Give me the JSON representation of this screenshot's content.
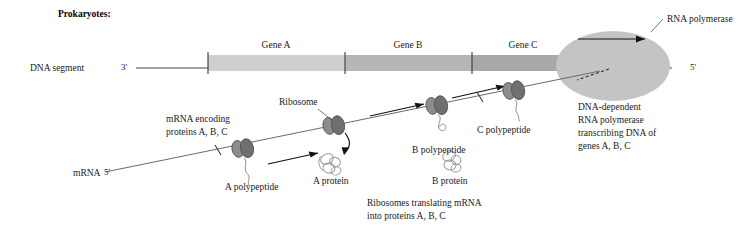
{
  "figure": {
    "title": "Prokaryotes:",
    "dna_row_label": "DNA segment",
    "dna_end_left": "3'",
    "dna_end_right": "5'",
    "mrna_row_label": "mRNA",
    "mrna_end_left": "5'"
  },
  "genes": [
    {
      "label": "Gene A",
      "shade": "#cfcfcf"
    },
    {
      "label": "Gene B",
      "shade": "#b6b6b6"
    },
    {
      "label": "Gene C",
      "shade": "#a8a8a8"
    }
  ],
  "polymerase": {
    "callout_label": "RNA polymerase",
    "caption_lines": [
      "DNA-dependent",
      "RNA polymerase",
      "transcribing DNA of",
      "genes A, B, C"
    ],
    "blob_color": "#c4c4c4"
  },
  "mrna": {
    "callout_lines": [
      "mRNA encoding",
      "proteins A, B, C"
    ],
    "ribosome_label": "Ribosome",
    "caption_lines": [
      "Ribosomes translating mRNA",
      "into proteins A, B, C"
    ]
  },
  "polypeptides": [
    {
      "label": "A polypeptide"
    },
    {
      "label": "B polypeptide"
    },
    {
      "label": "C polypeptide"
    }
  ],
  "proteins": [
    {
      "label": "A protein"
    },
    {
      "label": "B protein"
    }
  ],
  "colors": {
    "ribosome_light": "#8c8c8c",
    "ribosome_dark": "#6f6f6f",
    "line": "#4a4a4a",
    "text": "#1a1a1a"
  }
}
